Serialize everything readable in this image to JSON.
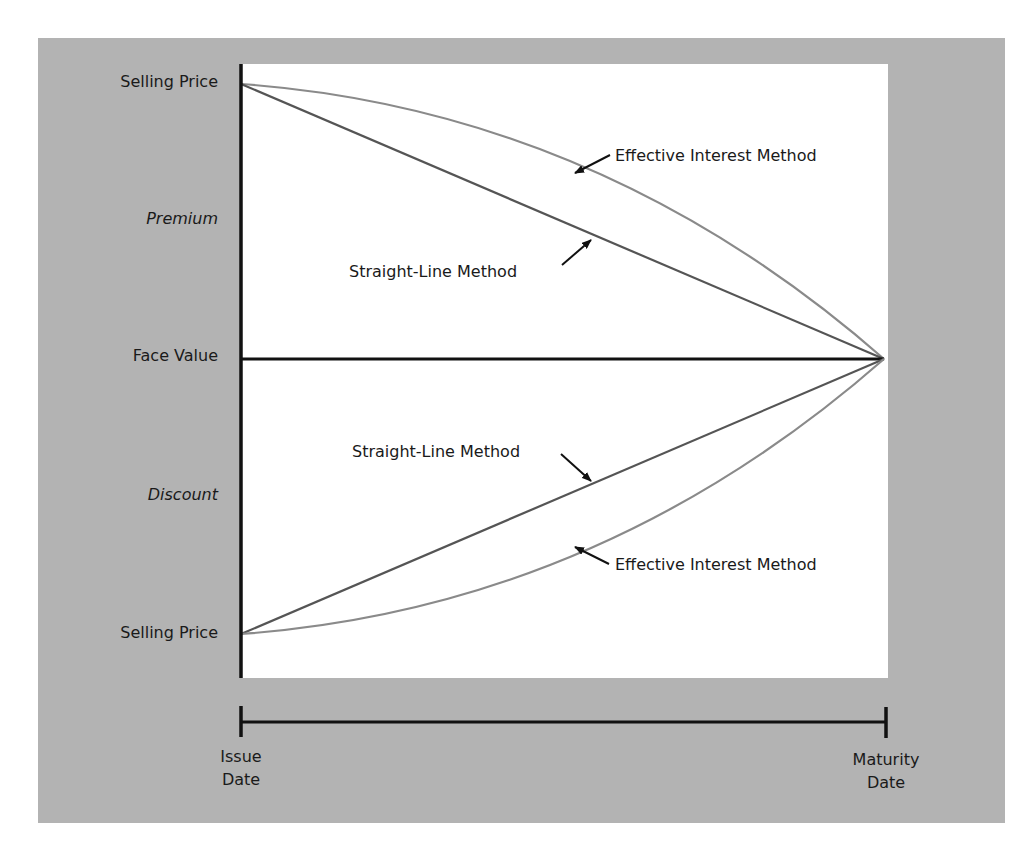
{
  "diagram": {
    "title": "",
    "y_axis_labels": {
      "top_selling_price": "Selling Price",
      "premium": "Premium",
      "face_value": "Face Value",
      "discount": "Discount",
      "bottom_selling_price": "Selling Price"
    },
    "annotations": {
      "premium_effective": "Effective Interest Method",
      "premium_straight": "Straight-Line Method",
      "discount_straight": "Straight-Line Method",
      "discount_effective": "Effective Interest Method"
    },
    "timeline": {
      "start_line1": "Issue",
      "start_line2": "Date",
      "end_line1": "Maturity",
      "end_line2": "Date"
    },
    "colors": {
      "panel_background": "#b3b3b3",
      "plot_background": "#ffffff",
      "axis": "#111111",
      "straight_line": "#555555",
      "effective_interest_curve": "#8a8a8a"
    }
  }
}
